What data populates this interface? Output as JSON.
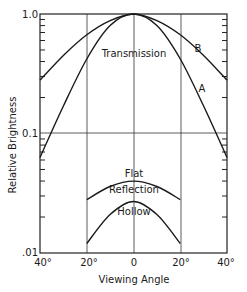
{
  "chart_data": {
    "type": "line",
    "title": "",
    "xlabel": "Viewing Angle",
    "ylabel": "Relative Brightness",
    "xlim": [
      -40,
      40
    ],
    "ylim": [
      0.01,
      1.0
    ],
    "yscale": "log",
    "grid": true,
    "x_ticks": [
      -40,
      -20,
      0,
      20,
      40
    ],
    "x_tick_labels": [
      "40°",
      "20°",
      "0",
      "20°",
      "40°"
    ],
    "y_tick_labels": [
      "1.0",
      "0.1",
      ".01"
    ],
    "y_ticks": [
      1.0,
      0.1,
      0.01
    ],
    "legend": "none (curves labeled inline)",
    "annotations": [
      "Transmission",
      "B",
      "A",
      "Flat",
      "Reflection",
      "Hollow"
    ],
    "series": [
      {
        "name": "Transmission B",
        "x": [
          -40,
          -30,
          -20,
          -10,
          0,
          10,
          20,
          30,
          40
        ],
        "values": [
          0.28,
          0.45,
          0.67,
          0.88,
          1.0,
          0.88,
          0.67,
          0.45,
          0.28
        ]
      },
      {
        "name": "Transmission A",
        "x": [
          -40,
          -30,
          -20,
          -10,
          0,
          10,
          20,
          30,
          40
        ],
        "values": [
          0.063,
          0.17,
          0.42,
          0.8,
          1.0,
          0.8,
          0.42,
          0.17,
          0.063
        ]
      },
      {
        "name": "Flat Reflection",
        "x": [
          -20,
          -10,
          0,
          10,
          20
        ],
        "values": [
          0.028,
          0.036,
          0.04,
          0.036,
          0.028
        ]
      },
      {
        "name": "Hollow Reflection",
        "x": [
          -20,
          -10,
          0,
          10,
          20
        ],
        "values": [
          0.012,
          0.021,
          0.027,
          0.021,
          0.012
        ]
      }
    ]
  },
  "labels": {
    "ylabel": "Relative Brightness",
    "xlabel": "Viewing Angle",
    "transmission": "Transmission",
    "curve_b": "B",
    "curve_a": "A",
    "flat": "Flat",
    "reflection": "Reflection",
    "hollow": "Hollow",
    "y_top": "1.0",
    "y_mid": "0.1",
    "y_bot": ".01",
    "x_m40": "40°",
    "x_m20": "20°",
    "x_0": "0",
    "x_p20": "20°",
    "x_p40": "40°"
  }
}
